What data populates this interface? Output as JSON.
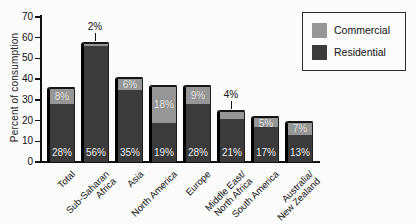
{
  "chart_data": {
    "type": "bar",
    "stacked": true,
    "title": "",
    "ylabel": "Percent of consumption",
    "xlabel": "",
    "ylim": [
      0,
      70
    ],
    "yticks": [
      0,
      10,
      20,
      30,
      40,
      50,
      60,
      70
    ],
    "grid": false,
    "legend_position": "top-right",
    "categories": [
      "Total",
      "Sub-Saharan\nAfrica",
      "Asia",
      "North America",
      "Europe",
      "Middle East/\nNorth Africa",
      "South America",
      "Australia/\nNew Zealand"
    ],
    "series": [
      {
        "name": "Residential",
        "color": "#3b3b3b",
        "values": [
          28,
          56,
          35,
          19,
          28,
          21,
          17,
          13
        ],
        "labels": [
          "28%",
          "56%",
          "35%",
          "19%",
          "28%",
          "21%",
          "17%",
          "13%"
        ]
      },
      {
        "name": "Commercial",
        "color": "#969696",
        "values": [
          8,
          2,
          6,
          18,
          9,
          4,
          5,
          7
        ],
        "labels": [
          "8%",
          "2%",
          "6%",
          "18%",
          "9%",
          "4%",
          "5%",
          "7%"
        ]
      }
    ]
  },
  "legend": {
    "items": [
      {
        "label": "Commercial",
        "color": "#969696"
      },
      {
        "label": "Residential",
        "color": "#3b3b3b"
      }
    ]
  }
}
